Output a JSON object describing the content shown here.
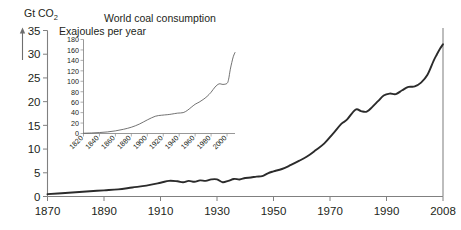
{
  "chart_data": [
    {
      "id": "main",
      "type": "line",
      "title": "",
      "ylabel": "Gt CO2",
      "ylabel_display": "Gt CO₂",
      "xlabel": "",
      "xlim": [
        1870,
        2008
      ],
      "ylim": [
        0,
        35
      ],
      "yticks": [
        0,
        5,
        10,
        15,
        20,
        25,
        30,
        35
      ],
      "xticks": [
        1870,
        1890,
        1910,
        1930,
        1950,
        1970,
        1990,
        2008
      ],
      "grid": false,
      "legend": "none",
      "series": [
        {
          "name": "Global CO2 emissions",
          "x": [
            1870,
            1875,
            1880,
            1885,
            1890,
            1895,
            1900,
            1905,
            1910,
            1913,
            1916,
            1918,
            1920,
            1922,
            1924,
            1926,
            1928,
            1930,
            1932,
            1934,
            1936,
            1938,
            1940,
            1942,
            1944,
            1946,
            1948,
            1950,
            1953,
            1956,
            1959,
            1962,
            1965,
            1968,
            1971,
            1974,
            1976,
            1979,
            1981,
            1983,
            1985,
            1987,
            1989,
            1991,
            1993,
            1995,
            1997,
            1999,
            2001,
            2003,
            2005,
            2006,
            2007,
            2008
          ],
          "values": [
            0.5,
            0.7,
            0.9,
            1.1,
            1.3,
            1.5,
            1.9,
            2.3,
            2.9,
            3.3,
            3.2,
            3.0,
            3.3,
            3.1,
            3.4,
            3.3,
            3.6,
            3.6,
            3.0,
            3.3,
            3.7,
            3.6,
            3.9,
            4.0,
            4.2,
            4.3,
            4.9,
            5.3,
            5.8,
            6.6,
            7.5,
            8.5,
            9.8,
            11.2,
            13.2,
            15.3,
            16.2,
            18.3,
            18.0,
            17.9,
            18.9,
            20.1,
            21.3,
            21.7,
            21.6,
            22.4,
            23.1,
            23.2,
            24.0,
            25.6,
            28.6,
            29.9,
            31.1,
            32.1
          ],
          "color": "#2b2b2b"
        }
      ]
    },
    {
      "id": "inset",
      "type": "line",
      "title": "World coal consumption",
      "subtitle": "Exajoules per year",
      "ylabel": "",
      "xlabel": "",
      "xlim": [
        1820,
        2010
      ],
      "ylim": [
        0,
        180
      ],
      "yticks": [
        0,
        20,
        40,
        60,
        80,
        100,
        120,
        140,
        160,
        180
      ],
      "xticks": [
        1820,
        1840,
        1860,
        1880,
        1900,
        1920,
        1940,
        1960,
        1980,
        2000
      ],
      "grid": false,
      "legend": "none",
      "series": [
        {
          "name": "World coal consumption",
          "x": [
            1820,
            1830,
            1840,
            1850,
            1860,
            1870,
            1880,
            1890,
            1900,
            1910,
            1918,
            1925,
            1930,
            1938,
            1945,
            1950,
            1955,
            1960,
            1965,
            1970,
            1975,
            1980,
            1985,
            1990,
            1995,
            2000,
            2002,
            2004,
            2006,
            2008,
            2010
          ],
          "values": [
            0.5,
            1,
            1.8,
            3,
            5,
            8,
            12,
            18,
            26,
            33,
            35,
            36,
            37,
            39,
            40,
            44,
            50,
            56,
            60,
            65,
            71,
            79,
            89,
            95,
            94,
            96,
            104,
            122,
            136,
            148,
            155
          ],
          "color": "#5a5a5a"
        }
      ]
    }
  ],
  "main_chart": {
    "ylabel": "Gt CO₂",
    "ytick_labels": [
      "0",
      "5",
      "10",
      "15",
      "20",
      "25",
      "30",
      "35"
    ],
    "xtick_labels": [
      "1870",
      "1890",
      "1910",
      "1930",
      "1950",
      "1970",
      "1990",
      "2008"
    ]
  },
  "inset_chart": {
    "title": "World coal consumption",
    "subtitle": "Exajoules per year",
    "ytick_labels": [
      "180",
      "160",
      "140",
      "120",
      "100",
      "80",
      "60",
      "40",
      "20",
      "0"
    ],
    "xtick_labels": [
      "1820",
      "1840",
      "1860",
      "1880",
      "1900",
      "1920",
      "1940",
      "1960",
      "1980",
      "2000"
    ]
  },
  "colors": {
    "main_curve": "#2b2b2b",
    "inset_curve": "#5a5a5a",
    "axis": "#808080",
    "text": "#231f20",
    "background": "#ffffff"
  }
}
